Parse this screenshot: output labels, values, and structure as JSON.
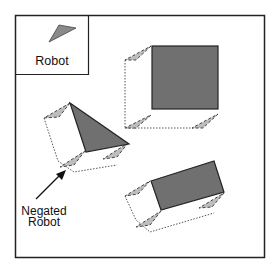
{
  "legend": {
    "label": "Robot",
    "icon": "robot-triangle-icon"
  },
  "annotation": {
    "line1": "Negated",
    "line2": "Robot",
    "target": "negated-robot-triangle"
  },
  "colors": {
    "obstacle_fill": "#707070",
    "robot_fill": "#b4b4b4",
    "frame_stroke": "#222222",
    "background": "#ffffff"
  },
  "obstacles": [
    {
      "name": "square-obstacle",
      "shape": "square"
    },
    {
      "name": "triangle-obstacle",
      "shape": "triangle"
    },
    {
      "name": "rectangle-obstacle",
      "shape": "rotated-rectangle"
    }
  ]
}
